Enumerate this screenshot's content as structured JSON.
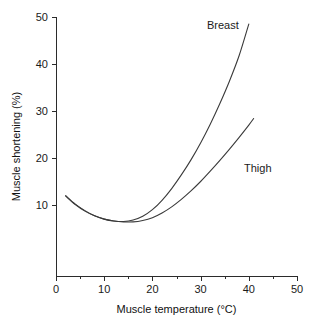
{
  "chart_data": {
    "type": "line",
    "title": "",
    "xlabel": "Muscle temperature (°C)",
    "ylabel": "Muscle shortening (%)",
    "xlim": [
      0,
      50
    ],
    "ylim": [
      -5,
      50
    ],
    "grid": false,
    "legend_position": "inline-annotation",
    "xticks": [
      0,
      10,
      20,
      30,
      40,
      50
    ],
    "xtick_labels": [
      "0",
      "10",
      "20",
      "30",
      "40",
      "50"
    ],
    "xminor_ticks": [
      5,
      15,
      25,
      35,
      45
    ],
    "yticks": [
      10,
      20,
      30,
      40,
      50
    ],
    "ytick_labels": [
      "10",
      "20",
      "30",
      "40",
      "50"
    ],
    "series": [
      {
        "name": "Breast",
        "label": "Breast",
        "color": "#3a3a3a",
        "x": [
          2,
          4,
          6,
          8,
          10,
          12,
          14,
          16,
          18,
          20,
          22,
          24,
          26,
          28,
          30,
          32,
          34,
          36,
          38,
          40
        ],
        "values": [
          12.0,
          10.2,
          8.8,
          7.7,
          7.0,
          6.6,
          6.5,
          6.8,
          7.6,
          9.0,
          11.0,
          13.5,
          16.4,
          19.6,
          23.2,
          27.2,
          31.6,
          36.4,
          41.8,
          48.5
        ]
      },
      {
        "name": "Thigh",
        "label": "Thigh",
        "color": "#3a3a3a",
        "x": [
          2,
          4,
          6,
          8,
          10,
          12,
          14,
          16,
          18,
          20,
          22,
          24,
          26,
          28,
          30,
          32,
          34,
          36,
          38,
          40,
          41
        ],
        "values": [
          11.9,
          10.1,
          8.7,
          7.7,
          7.0,
          6.6,
          6.4,
          6.4,
          6.7,
          7.3,
          8.3,
          9.6,
          11.2,
          13.0,
          15.0,
          17.2,
          19.5,
          21.9,
          24.4,
          27.0,
          28.4
        ]
      }
    ]
  },
  "annotations": [
    {
      "name": "breast-label",
      "text": "Breast"
    },
    {
      "name": "thigh-label",
      "text": "Thigh"
    }
  ],
  "axes": {
    "x_title": "Muscle temperature (°C)",
    "y_title": "Muscle shortening (%)"
  }
}
